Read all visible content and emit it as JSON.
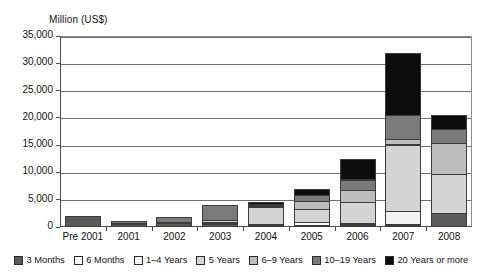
{
  "axis_title": "Million (US$)",
  "chart_data": {
    "type": "bar",
    "subtype": "stacked-vertical",
    "title": "",
    "subtitle": "",
    "xlabel": "",
    "ylabel": "Million (US$)",
    "ylim": [
      0,
      35000
    ],
    "ytick_values": [
      0,
      5000,
      10000,
      15000,
      20000,
      25000,
      30000,
      35000
    ],
    "ytick_labels": [
      "0",
      "5,000",
      "10,000",
      "15,000",
      "20,000",
      "25,000",
      "30,000",
      "35,000"
    ],
    "grid": true,
    "grid_axis": "y",
    "legend_position": "bottom",
    "categories": [
      "Pre 2001",
      "2001",
      "2002",
      "2003",
      "2004",
      "2005",
      "2006",
      "2007",
      "2008"
    ],
    "series": [
      {
        "name": "3 Months",
        "color": "#595959",
        "values": [
          2050,
          550,
          700,
          500,
          150,
          150,
          300,
          350,
          2550
        ]
      },
      {
        "name": "6 Months",
        "color": "#ffffff",
        "values": [
          0,
          150,
          150,
          250,
          200,
          750,
          400,
          200,
          0
        ]
      },
      {
        "name": "1–4 Years",
        "color": "#f2f2f2",
        "values": [
          0,
          0,
          0,
          300,
          0,
          0,
          0,
          2450,
          0
        ]
      },
      {
        "name": "5 Years",
        "color": "#d4d4d4",
        "values": [
          0,
          0,
          0,
          450,
          3300,
          2400,
          4100,
          12350,
          7250
        ]
      },
      {
        "name": "6–9 Years",
        "color": "#bdbdbd",
        "values": [
          0,
          0,
          0,
          0,
          350,
          1700,
          2300,
          1200,
          5900
        ]
      },
      {
        "name": "10–19 Years",
        "color": "#7a7a7a",
        "values": [
          0,
          500,
          1150,
          2900,
          350,
          1250,
          2100,
          4450,
          2650
        ]
      },
      {
        "name": "20 Years or more",
        "color": "#0d0d0d",
        "values": [
          0,
          0,
          0,
          0,
          550,
          1200,
          4000,
          11600,
          2750
        ]
      }
    ],
    "totals": [
      2050,
      1200,
      2000,
      4400,
      4900,
      7450,
      13200,
      32600,
      21100
    ]
  },
  "legend": {
    "items": [
      {
        "label": "3 Months"
      },
      {
        "label": "6 Months"
      },
      {
        "label": "1–4 Years"
      },
      {
        "label": "5 Years"
      },
      {
        "label": "6–9 Years"
      },
      {
        "label": "10–19 Years"
      },
      {
        "label": "20 Years or more"
      }
    ]
  }
}
